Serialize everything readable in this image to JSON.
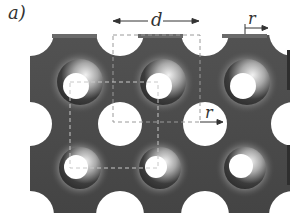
{
  "figure": {
    "panel_label": "a)",
    "annotations": {
      "period_label": "d",
      "radius_label_top": "r",
      "radius_label_mid": "r"
    },
    "colors": {
      "slab": "#4a4a4a",
      "slab_dark": "#2e2e2e",
      "highlight": "#e8e8e8",
      "hole": "#ffffff",
      "dashes": "#bdbdbd",
      "arrow": "#333333"
    }
  }
}
